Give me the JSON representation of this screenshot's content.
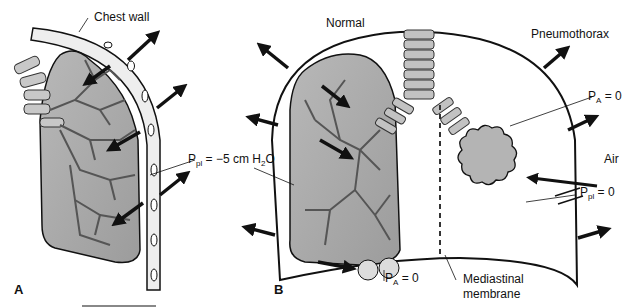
{
  "figure": {
    "panel_a": {
      "letter": "A",
      "labels": {
        "chest_wall": "Chest wall",
        "pleural_pressure_prefix": "P",
        "pleural_pressure_sub": "pl",
        "pleural_pressure_value": " = −5 cm H",
        "pleural_pressure_sub2": "2",
        "pleural_pressure_suffix": "O"
      }
    },
    "panel_b": {
      "letter": "B",
      "labels": {
        "normal": "Normal",
        "pneumothorax": "Pneumothorax",
        "alveolar_pressure_top_prefix": "P",
        "alveolar_pressure_top_sub": "A",
        "alveolar_pressure_top_value": " = 0",
        "air": "Air",
        "pleural_pressure_prefix": "P",
        "pleural_pressure_sub": "pl",
        "pleural_pressure_value": " = 0",
        "alveolar_pressure_bottom_prefix": "P",
        "alveolar_pressure_bottom_sub": "A",
        "alveolar_pressure_bottom_value": " = 0",
        "mediastinal_membrane_line1": "Mediastinal",
        "mediastinal_membrane_line2": "membrane"
      }
    },
    "colors": {
      "lung_fill": "#a9a9a9",
      "airway_fill": "#c8c8c8",
      "outline": "#111111",
      "arrow": "#111111"
    }
  }
}
